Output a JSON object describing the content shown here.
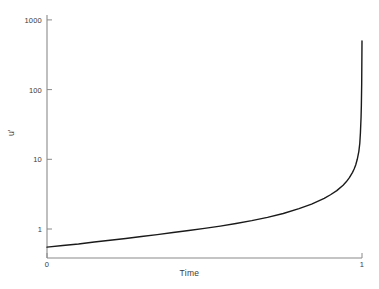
{
  "chart_data": {
    "type": "line",
    "title": "",
    "xlabel": "Time",
    "ylabel": "u'",
    "xscale": "linear",
    "yscale": "log",
    "xlim": [
      0,
      1
    ],
    "ylim": [
      0.5,
      1000
    ],
    "grid": false,
    "legend": null,
    "xticks": [
      {
        "value": 0,
        "label": "0"
      },
      {
        "value": 1,
        "label": "1"
      }
    ],
    "yticks": [
      {
        "value": 1,
        "label": "1"
      },
      {
        "value": 10,
        "label": "10"
      },
      {
        "value": 100,
        "label": "100"
      },
      {
        "value": 1000,
        "label": "1000"
      }
    ],
    "series": [
      {
        "name": "u'",
        "color": "#1a1a1a",
        "linewidth": 1.4,
        "x": [
          0.0,
          0.05,
          0.1,
          0.15,
          0.2,
          0.25,
          0.3,
          0.35,
          0.4,
          0.45,
          0.5,
          0.55,
          0.6,
          0.65,
          0.7,
          0.75,
          0.8,
          0.84,
          0.88,
          0.9,
          0.92,
          0.94,
          0.95,
          0.96,
          0.97,
          0.975,
          0.98,
          0.985,
          0.99,
          0.993,
          0.995,
          0.997,
          0.998,
          0.999,
          1.0
        ],
        "y": [
          0.55,
          0.58,
          0.61,
          0.65,
          0.69,
          0.73,
          0.78,
          0.83,
          0.89,
          0.95,
          1.02,
          1.1,
          1.2,
          1.32,
          1.47,
          1.67,
          1.96,
          2.28,
          2.75,
          3.1,
          3.55,
          4.25,
          4.75,
          5.45,
          6.5,
          7.25,
          8.3,
          10.0,
          13.0,
          17.0,
          24.0,
          40.0,
          60.0,
          120.0,
          500.0
        ]
      }
    ],
    "annotations": []
  },
  "axes": {
    "x_label": "Time",
    "y_label": "u'"
  }
}
